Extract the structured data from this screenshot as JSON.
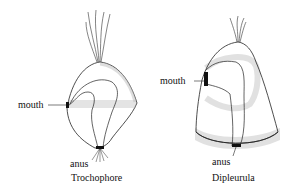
{
  "figures": [
    {
      "name": "Trochophore",
      "labels": {
        "mouth": "mouth",
        "anus": "anus"
      },
      "caption": "Trochophore"
    },
    {
      "name": "Dipleurula",
      "labels": {
        "mouth": "mouth",
        "anus": "anus"
      },
      "caption": "Dipleurula"
    }
  ],
  "colors": {
    "line": "#222222",
    "cilia": "#9a9a9a"
  }
}
